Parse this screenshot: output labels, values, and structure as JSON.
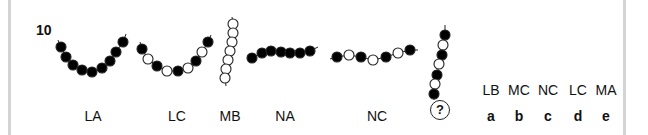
{
  "question": {
    "number": "10",
    "unknown_symbol": "?"
  },
  "figures": [
    {
      "label": "LA",
      "beads": [
        "B",
        "B",
        "B",
        "B",
        "B",
        "B",
        "B",
        "B",
        "B"
      ],
      "shape": "U-curve"
    },
    {
      "label": "LC",
      "beads": [
        "B",
        "W",
        "B",
        "W",
        "B",
        "W",
        "B",
        "W",
        "B"
      ],
      "shape": "U-curve"
    },
    {
      "label": "MB",
      "beads": [
        "W",
        "W",
        "W",
        "W",
        "W",
        "W",
        "W"
      ],
      "shape": "vertical"
    },
    {
      "label": "NA",
      "beads": [
        "B",
        "B",
        "B",
        "B",
        "B",
        "B",
        "B"
      ],
      "shape": "flat-arc"
    },
    {
      "label": "NC",
      "beads": [
        "B",
        "W",
        "B",
        "W",
        "B",
        "W",
        "B"
      ],
      "shape": "flat-line"
    },
    {
      "label": "?",
      "beads": [
        "B",
        "W",
        "B",
        "W",
        "B",
        "W",
        "B"
      ],
      "shape": "vertical"
    }
  ],
  "options": [
    {
      "code": "LB",
      "letter": "a"
    },
    {
      "code": "MC",
      "letter": "b"
    },
    {
      "code": "NC",
      "letter": "c"
    },
    {
      "code": "LC",
      "letter": "d"
    },
    {
      "code": "MA",
      "letter": "e"
    }
  ],
  "colors": {
    "bead_fill_dark": "#000000",
    "bead_fill_light": "#ffffff",
    "stroke": "#222222",
    "frame": "#d4d4d4"
  }
}
